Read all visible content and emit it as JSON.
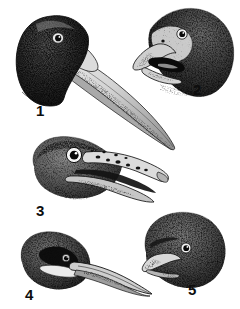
{
  "plate": {
    "title": "Plate of five bird heads",
    "medium": "stipple engraving",
    "background_color": "#ffffff",
    "ink_color": "#1a1a1a",
    "width": 240,
    "height": 309,
    "figure_count": 5
  },
  "figures": [
    {
      "number": "1",
      "label": "1",
      "description": "Dark stippled head with very long, straight, tapering pale bill angled down to the right",
      "bill": "very long straight tapering",
      "crown": "dark",
      "eye": "small dark eye with pale ring",
      "label_x": 36,
      "label_y": 103
    },
    {
      "number": "2",
      "label": "2",
      "description": "Parrot-like head facing left with open hooked beak and dark mouth interior",
      "bill": "short deep hooked, open",
      "crown": "densely stippled dark",
      "eye": "dark eye with white eye-ring",
      "label_x": 193,
      "label_y": 82
    },
    {
      "number": "3",
      "label": "3",
      "description": "Head with large prominent eye and open spotted mandibles with hooked tip",
      "bill": "long open mandibles, dark blotches",
      "crown": "stippled grey",
      "eye": "large white iris with dark pupil",
      "label_x": 36,
      "label_y": 203
    },
    {
      "number": "4",
      "label": "4",
      "description": "Rounded fluffy head with dark face mask, pale throat band and long slender decurved bill",
      "bill": "long slender decurved",
      "crown": "soft stippled rounded",
      "eye": "small dark eye in dark mask",
      "label_x": 25,
      "label_y": 287
    },
    {
      "number": "5",
      "label": "5",
      "description": "Round fluffy parrot head with short pale hooked bill",
      "bill": "short pale hooked",
      "crown": "round densely stippled",
      "eye": "dark eye with pale ring",
      "label_x": 188,
      "label_y": 282
    }
  ]
}
